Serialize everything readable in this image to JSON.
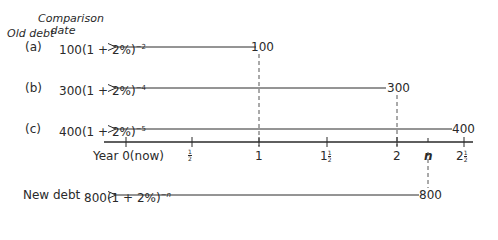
{
  "header": {
    "old_debt_label": "Old debt",
    "comparison_label_line1": "Comparison",
    "comparison_label_line2": "date"
  },
  "rows": [
    {
      "label": "(a)",
      "expr_base": "100(1 + 2%)",
      "exponent": "−2",
      "amount": "100",
      "due_year": "1"
    },
    {
      "label": "(b)",
      "expr_base": "300(1 + 2%)",
      "exponent": "−4",
      "amount": "300",
      "due_year": "2"
    },
    {
      "label": "(c)",
      "expr_base": "400(1 + 2%)",
      "exponent": "−5",
      "amount": "400",
      "due_year": "2½"
    }
  ],
  "new_debt": {
    "label": "New debt",
    "expr_base": "800(1 + 2%)",
    "exponent": "−n",
    "amount": "800",
    "due_year": "n"
  },
  "axis": {
    "ticks": [
      {
        "label": "Year 0(now)",
        "value": 0
      },
      {
        "label": "1/2",
        "value": 0.5
      },
      {
        "label": "1",
        "value": 1
      },
      {
        "label": "1½",
        "value": 1.5
      },
      {
        "label": "2",
        "value": 2
      },
      {
        "label": "n",
        "value": 2.15
      },
      {
        "label": "2½",
        "value": 2.5
      }
    ],
    "tick_whole": {
      "one": "1",
      "one_half_whole": "1",
      "two": "2",
      "two_half_whole": "2",
      "n": "n",
      "year0": "Year 0(now)"
    },
    "half_num": "1",
    "half_den": "2"
  },
  "colors": {
    "ink": "#2a2a2a",
    "dash": "#555555"
  }
}
